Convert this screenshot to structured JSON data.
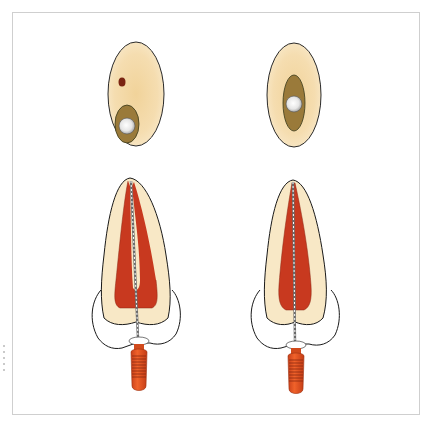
{
  "figure": {
    "panels": [
      {
        "id": "left",
        "cross_section": {
          "label": "Cross-section with separate canal (dark dot) and file in second canal"
        },
        "tooth": {
          "label": "Tooth with bifurcated pulp canal and file in one branch"
        }
      },
      {
        "id": "right",
        "cross_section": {
          "label": "Cross-section with single elongated canal containing file"
        },
        "tooth": {
          "label": "Tooth with single tapered canal and file centered"
        }
      }
    ]
  },
  "colors": {
    "dentin_fill": "#f8e8c6",
    "cross_section_fill": "#f3d9a6",
    "pulp": "#c8391f",
    "canal_olive": "#9a7a3a",
    "dark_dot": "#7a2412",
    "handle": "#e8541f",
    "handle_rings": "#8a2a10",
    "outline": "#1a1a1a",
    "frame": "#cfcfcf"
  }
}
